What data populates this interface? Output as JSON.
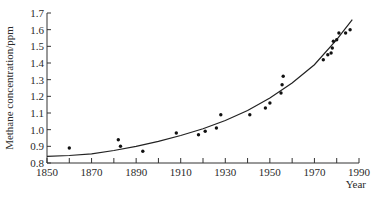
{
  "chart_data": {
    "type": "scatter",
    "title": "",
    "xlabel": "Year",
    "ylabel": "Methane concentration/ppm",
    "xlim": [
      1850,
      1990
    ],
    "ylim": [
      0.8,
      1.7
    ],
    "grid": false,
    "legend": null,
    "x_ticks": [
      1850,
      1870,
      1890,
      1910,
      1930,
      1950,
      1970,
      1990
    ],
    "x_minor_ticks": [
      1860,
      1880,
      1900,
      1920,
      1940,
      1960,
      1980
    ],
    "y_ticks": [
      "0.8",
      "0.9",
      "1.0",
      "1.1",
      "1.2",
      "1.3",
      "1.4",
      "1.5",
      "1.6",
      "1.7"
    ],
    "series": [
      {
        "name": "Measured methane concentration",
        "kind": "scatter",
        "points": [
          [
            1860,
            0.89
          ],
          [
            1882,
            0.94
          ],
          [
            1883,
            0.9
          ],
          [
            1893,
            0.87
          ],
          [
            1908,
            0.98
          ],
          [
            1918,
            0.97
          ],
          [
            1921,
            0.99
          ],
          [
            1926,
            1.01
          ],
          [
            1928,
            1.09
          ],
          [
            1941,
            1.09
          ],
          [
            1948,
            1.13
          ],
          [
            1950,
            1.16
          ],
          [
            1955,
            1.22
          ],
          [
            1955.5,
            1.27
          ],
          [
            1956,
            1.32
          ],
          [
            1974,
            1.42
          ],
          [
            1976,
            1.45
          ],
          [
            1977.5,
            1.46
          ],
          [
            1978,
            1.49
          ],
          [
            1978.5,
            1.53
          ],
          [
            1980,
            1.54
          ],
          [
            1981,
            1.58
          ],
          [
            1984,
            1.58
          ],
          [
            1986,
            1.6
          ]
        ]
      },
      {
        "name": "Fitted trend",
        "kind": "line",
        "points": [
          [
            1850,
            0.84
          ],
          [
            1860,
            0.845
          ],
          [
            1870,
            0.855
          ],
          [
            1880,
            0.875
          ],
          [
            1890,
            0.9
          ],
          [
            1900,
            0.93
          ],
          [
            1910,
            0.965
          ],
          [
            1920,
            1.005
          ],
          [
            1930,
            1.055
          ],
          [
            1940,
            1.115
          ],
          [
            1950,
            1.19
          ],
          [
            1960,
            1.28
          ],
          [
            1970,
            1.39
          ],
          [
            1980,
            1.54
          ],
          [
            1987,
            1.66
          ]
        ]
      }
    ]
  }
}
